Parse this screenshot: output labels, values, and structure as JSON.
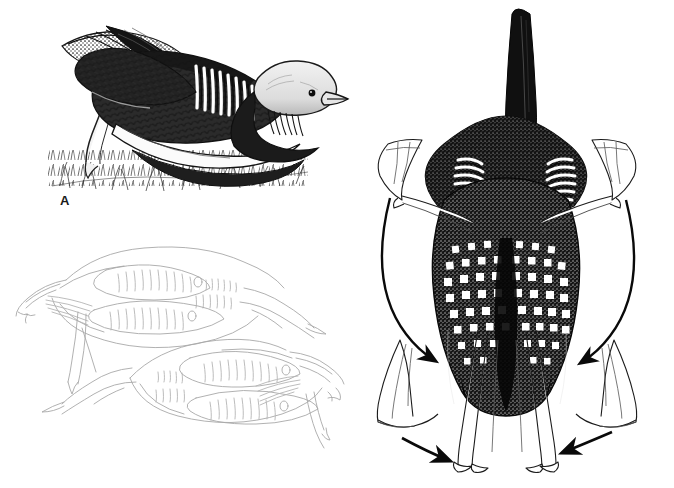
{
  "figure": {
    "type": "scientific-illustration-plate",
    "medium": "pen-and-ink line drawing",
    "background_color": "#ffffff",
    "ink_color": "#1a1a1a",
    "panel_count": 3,
    "width_px": 674,
    "height_px": 488
  },
  "labels": {
    "a": "A",
    "b": "B",
    "c": "C"
  },
  "panels": [
    {
      "id": "a",
      "label": "A",
      "label_position": {
        "x": 60,
        "y": 194
      },
      "view": "lateral",
      "rendering": "fully shaded stipple and crosshatch",
      "description": "Single loon in low prone display posture on grassy ground, body flattened forward, head held low, wing and tail raised at rear",
      "features": [
        "pale gray head with dark eye",
        "long pointed bill directed right",
        "vertical white striped neck patch",
        "scalloped scale-patterned dark back",
        "white flank stripe along waterline",
        "raised wing and tail at rear",
        "pale extended leg and foot",
        "hatched grass and ground texture"
      ]
    },
    {
      "id": "b",
      "label": "B",
      "label_position": {
        "x": 61,
        "y": 341
      },
      "view": "dorsal-lateral pair",
      "rendering": "light gray outline only, unshaded schematic",
      "description": "Two loons in mirrored circling display, upper bird facing right, lower bird facing left, bodies low and necks extended",
      "bird_count": 2,
      "features": [
        "outline-only contour drawing",
        "ladder-pattern back markings",
        "stippled neck collar indicated by small ovals",
        "extended necks held near the ground",
        "legs and webbed feet trailing behind",
        "mirrored antiparallel arrangement"
      ]
    },
    {
      "id": "c",
      "label": "C",
      "label_position": {
        "x": 386,
        "y": 430
      },
      "view": "frontal",
      "rendering": "fully shaded stipple with outline feet",
      "description": "Loon seen head-on in penguin-dance display, bill pointed vertically upward, body raised, webbed feet paddling",
      "features": [
        "bill held vertically upward",
        "dark head with stippled shading",
        "four striped white neck collar patches",
        "dense white square spots across breast and back",
        "outline-drawn webbed feet in two positions",
        "two curved motion arcs on left and right",
        "two straight converging arrows at base"
      ],
      "annotations": [
        {
          "name": "left-motion-arc",
          "kind": "curved-arrow",
          "meaning": "path of left foot sweeping down and inward"
        },
        {
          "name": "right-motion-arc",
          "kind": "curved-arrow",
          "meaning": "path of right foot sweeping down and inward"
        },
        {
          "name": "left-convergence-arrow",
          "kind": "straight-arrow",
          "meaning": "left foot drawn toward body midline"
        },
        {
          "name": "right-convergence-arrow",
          "kind": "straight-arrow",
          "meaning": "right foot drawn toward body midline"
        }
      ]
    }
  ]
}
